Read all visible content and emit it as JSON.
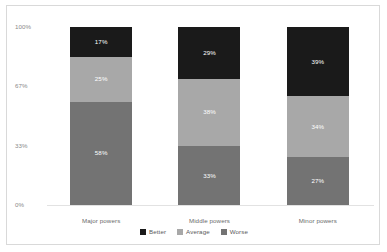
{
  "chart_data": {
    "type": "bar",
    "stacked": true,
    "normalized_percent": true,
    "title": "",
    "subtitle": "",
    "xlabel": "",
    "ylabel": "",
    "categories": [
      "Major powers",
      "Middle powers",
      "Minor powers"
    ],
    "series": [
      {
        "name": "Better",
        "values": [
          17,
          29,
          39
        ],
        "color": "#1a1a1a"
      },
      {
        "name": "Average",
        "values": [
          25,
          38,
          34
        ],
        "color": "#a8a8a8"
      },
      {
        "name": "Worse",
        "values": [
          58,
          33,
          27
        ],
        "color": "#737373"
      }
    ],
    "stack_order_top_to_bottom": [
      "Better",
      "Average",
      "Worse"
    ],
    "value_labels": [
      [
        "17%",
        "25%",
        "58%"
      ],
      [
        "29%",
        "38%",
        "33%"
      ],
      [
        "39%",
        "34%",
        "27%"
      ]
    ],
    "yticks": [
      100,
      67,
      33,
      0
    ],
    "ytick_labels": [
      "100%",
      "67%",
      "33%",
      "0%"
    ],
    "ylim": [
      0,
      100
    ],
    "grid": false,
    "legend_position": "bottom",
    "legend": [
      "Better",
      "Average",
      "Worse"
    ]
  },
  "axis": {
    "y_ticks": [
      {
        "label": "100%",
        "value": 100
      },
      {
        "label": "67%",
        "value": 67
      },
      {
        "label": "33%",
        "value": 33
      },
      {
        "label": "0%",
        "value": 0
      }
    ]
  },
  "bars": [
    {
      "category": "Major powers",
      "segments": [
        {
          "name": "Better",
          "label": "17%",
          "value": 17,
          "color": "#1a1a1a"
        },
        {
          "name": "Average",
          "label": "25%",
          "value": 25,
          "color": "#a8a8a8"
        },
        {
          "name": "Worse",
          "label": "58%",
          "value": 58,
          "color": "#737373"
        }
      ]
    },
    {
      "category": "Middle powers",
      "segments": [
        {
          "name": "Better",
          "label": "29%",
          "value": 29,
          "color": "#1a1a1a"
        },
        {
          "name": "Average",
          "label": "38%",
          "value": 38,
          "color": "#a8a8a8"
        },
        {
          "name": "Worse",
          "label": "33%",
          "value": 33,
          "color": "#737373"
        }
      ]
    },
    {
      "category": "Minor powers",
      "segments": [
        {
          "name": "Better",
          "label": "39%",
          "value": 39,
          "color": "#1a1a1a"
        },
        {
          "name": "Average",
          "label": "34%",
          "value": 34,
          "color": "#a8a8a8"
        },
        {
          "name": "Worse",
          "label": "27%",
          "value": 27,
          "color": "#737373"
        }
      ]
    }
  ],
  "legend": {
    "items": [
      {
        "label": "Better",
        "color": "#1a1a1a"
      },
      {
        "label": "Average",
        "color": "#a8a8a8"
      },
      {
        "label": "Worse",
        "color": "#737373"
      }
    ]
  },
  "colors": {
    "better": "#1a1a1a",
    "average": "#a8a8a8",
    "worse": "#737373",
    "frame_border": "#d9d9d9",
    "axis_text": "#8a8a8a",
    "baseline": "#e2e2e2",
    "background": "#ffffff"
  }
}
